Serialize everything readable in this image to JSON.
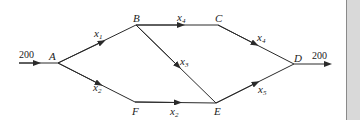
{
  "diagram": {
    "type": "network-flow",
    "nodes": [
      {
        "id": "A",
        "label": "A"
      },
      {
        "id": "B",
        "label": "B"
      },
      {
        "id": "C",
        "label": "C"
      },
      {
        "id": "D",
        "label": "D"
      },
      {
        "id": "E",
        "label": "E"
      },
      {
        "id": "F",
        "label": "F"
      }
    ],
    "edges": [
      {
        "from": "in",
        "to": "A",
        "label": "200"
      },
      {
        "from": "A",
        "to": "B",
        "var": "x",
        "sub": "1"
      },
      {
        "from": "A",
        "to": "F",
        "var": "x",
        "sub": "2"
      },
      {
        "from": "B",
        "to": "C",
        "var": "x",
        "sub": "4"
      },
      {
        "from": "B",
        "to": "E",
        "var": "x",
        "sub": "3"
      },
      {
        "from": "F",
        "to": "E",
        "var": "x",
        "sub": "2"
      },
      {
        "from": "C",
        "to": "D",
        "var": "x",
        "sub": "4"
      },
      {
        "from": "E",
        "to": "D",
        "var": "x",
        "sub": "5"
      },
      {
        "from": "D",
        "to": "out",
        "label": "200"
      }
    ],
    "colors": {
      "line": "#2a2a2a",
      "panel": "#d9d9d9"
    }
  }
}
